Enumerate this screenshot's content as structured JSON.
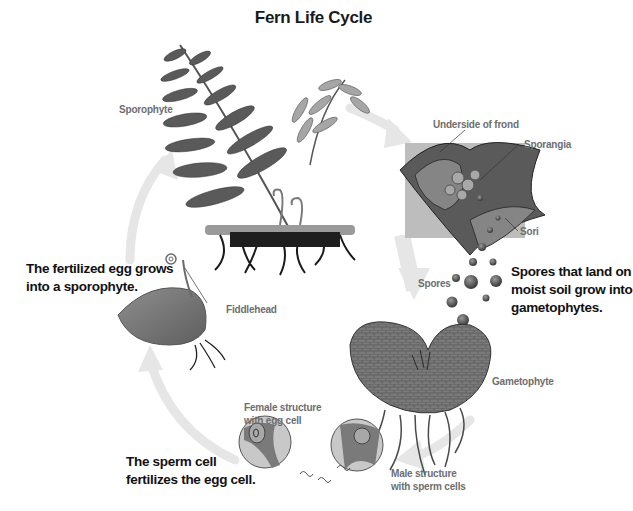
{
  "title": "Fern Life Cycle",
  "labels": {
    "sporophyte": "Sporophyte",
    "underside_of_frond": "Underside of frond",
    "sporangia": "Sporangia",
    "sori": "Sori",
    "spores": "Spores",
    "gametophyte": "Gametophyte",
    "fiddlehead": "Fiddlehead",
    "female_structure_line1": "Female structure",
    "female_structure_line2": "with egg cell",
    "male_structure_line1": "Male structure",
    "male_structure_line2": "with sperm cells"
  },
  "steps": {
    "spores_grow_line1": "Spores that land on",
    "spores_grow_line2": "moist soil grow into",
    "spores_grow_line3": "gametophytes.",
    "fertilized_egg_line1": "The fertilized egg grows",
    "fertilized_egg_line2": "into a sporophyte.",
    "sperm_fertilizes_line1": "The sperm cell",
    "sperm_fertilizes_line2": "fertilizes the egg cell."
  },
  "colors": {
    "text_dark": "#111111",
    "label_gray": "#6e6e6e",
    "cycle_arrow": "#e4e4e4",
    "plant_dark": "#4a4a4a",
    "plant_mid": "#7a7a7a",
    "plant_light": "#a8a8a8",
    "zoom_box": "#bdbdbd"
  }
}
